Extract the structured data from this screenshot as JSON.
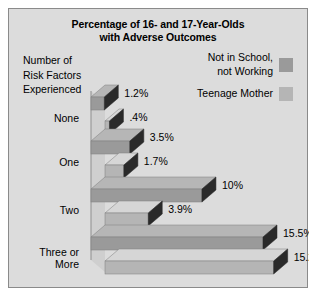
{
  "chart": {
    "title_lines": [
      "Percentage of 16- and 17-Year-Olds",
      "with Adverse Outcomes"
    ],
    "axis_title_lines": [
      "Number of",
      "Risk Factors",
      "Experienced"
    ]
  },
  "legend": {
    "items": [
      {
        "label": "Not in School,\nnot Working",
        "color": "#9a9a9a"
      },
      {
        "label": "Teenage Mother",
        "color": "#b5b5b5"
      }
    ]
  },
  "chart_data": {
    "type": "bar",
    "orientation": "horizontal",
    "title": "Percentage of 16- and 17-Year-Olds with Adverse Outcomes",
    "xlabel": "",
    "ylabel": "Number of Risk Factors Experienced",
    "categories": [
      "None",
      "One",
      "Two",
      "Three or More"
    ],
    "category_label_lines": [
      [
        "None"
      ],
      [
        "One"
      ],
      [
        "Two"
      ],
      [
        "Three or",
        "More"
      ]
    ],
    "series": [
      {
        "name": "Not in School, not Working",
        "color": "#9a9a9a",
        "values": [
          1.2,
          3.5,
          10,
          15.5
        ],
        "labels": [
          "1.2%",
          "3.5%",
          "10%",
          "15.5%"
        ]
      },
      {
        "name": "Teenage Mother",
        "color": "#b5b5b5",
        "values": [
          0.4,
          1.7,
          3.9,
          15.2
        ],
        "labels": [
          ".4%",
          "1.7%",
          "3.9%",
          "15.2%"
        ]
      }
    ],
    "xlim": [
      0,
      15.5
    ],
    "grid": false,
    "legend_position": "top-right",
    "style": "3d-bar"
  },
  "colors": {
    "panel_background": "#dcdcdc",
    "panel_border": "#8a8a8a",
    "bar_side_dark": "#2a2a2a",
    "bar_top_light": "#e3e3e3",
    "text": "#000000"
  }
}
